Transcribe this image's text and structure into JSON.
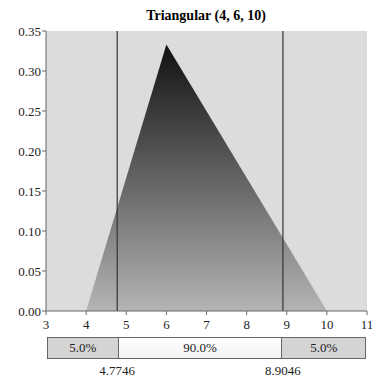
{
  "chart_data": {
    "type": "area",
    "title": "Triangular (4, 6, 10)",
    "distribution": {
      "name": "Triangular",
      "min": 4,
      "mode": 6,
      "max": 10
    },
    "x": [
      4,
      6,
      10
    ],
    "y": [
      0,
      0.3333,
      0
    ],
    "xlabel": "",
    "ylabel": "",
    "xlim": [
      3,
      11
    ],
    "ylim": [
      0,
      0.35
    ],
    "x_ticks": [
      "3",
      "4",
      "5",
      "6",
      "7",
      "8",
      "9",
      "10",
      "11"
    ],
    "y_ticks": [
      "0.00",
      "0.05",
      "0.10",
      "0.15",
      "0.20",
      "0.25",
      "0.30",
      "0.35"
    ],
    "grid": false,
    "legend": null,
    "markers": [
      4.7746,
      8.9046
    ],
    "percentile_bar": {
      "segments": [
        {
          "label": "5.0%",
          "from": 3,
          "to": 4.7746
        },
        {
          "label": "90.0%",
          "from": 4.7746,
          "to": 8.9046
        },
        {
          "label": "5.0%",
          "from": 8.9046,
          "to": 11
        }
      ],
      "cut_labels": [
        "4.7746",
        "8.9046"
      ]
    },
    "colors": {
      "plot_bg": "#dcdcdc",
      "fill_top": "#111111",
      "fill_bottom": "#b0b0b0",
      "line": "#333333"
    }
  }
}
